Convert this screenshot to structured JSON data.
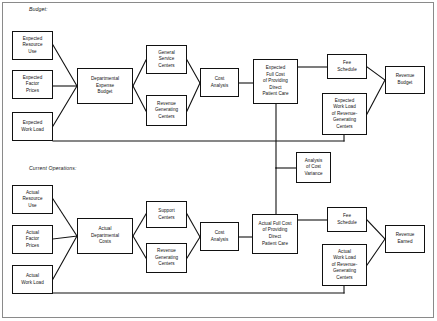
{
  "diagram": {
    "sections": [
      {
        "id": "budget",
        "label": "Budget:"
      },
      {
        "id": "current",
        "label": "Current Operations:"
      }
    ],
    "nodes": [
      {
        "id": "expected-resource-use",
        "label": "Expected\nResource\nUse",
        "x": 12,
        "y": 31,
        "w": 41,
        "h": 29
      },
      {
        "id": "expected-factor-prices",
        "label": "Expected\nFactor\nPrices",
        "x": 12,
        "y": 70,
        "w": 41,
        "h": 29
      },
      {
        "id": "expected-work-load",
        "label": "Expected\nWork Load",
        "x": 12,
        "y": 112,
        "w": 41,
        "h": 29
      },
      {
        "id": "departmental-expense-budget",
        "label": "Departmental\nExpense\nBudget",
        "x": 77,
        "y": 68,
        "w": 56,
        "h": 36
      },
      {
        "id": "general-service-centers",
        "label": "General\nService\nCenters",
        "x": 146,
        "y": 45,
        "w": 41,
        "h": 29
      },
      {
        "id": "revenue-generating-centers-b",
        "label": "Revenue\nGenerating\nCenters",
        "x": 146,
        "y": 95,
        "w": 41,
        "h": 31
      },
      {
        "id": "cost-analysis-budget",
        "label": "Cost\nAnalysis",
        "x": 200,
        "y": 68,
        "w": 39,
        "h": 29
      },
      {
        "id": "expected-full-cost",
        "label": "Expected\nFull Cost\nof Providing\nDirect\nPatient Care",
        "x": 253,
        "y": 59,
        "w": 45,
        "h": 45
      },
      {
        "id": "fee-schedule-budget",
        "label": "Fee\nSchedule",
        "x": 327,
        "y": 54,
        "w": 40,
        "h": 25
      },
      {
        "id": "expected-work-load-rgc",
        "label": "Expected\nWork Load\nof Revenue-\nGenerating\nCenters",
        "x": 322,
        "y": 93,
        "w": 45,
        "h": 42
      },
      {
        "id": "revenue-budget",
        "label": "Revenue\nBudget",
        "x": 385,
        "y": 66,
        "w": 40,
        "h": 28
      },
      {
        "id": "analysis-of-cost-variance",
        "label": "Analysis\nof Cost\nVariance",
        "x": 296,
        "y": 152,
        "w": 35,
        "h": 31
      },
      {
        "id": "actual-resource-use",
        "label": "Actual\nResource\nUse",
        "x": 12,
        "y": 185,
        "w": 41,
        "h": 29
      },
      {
        "id": "actual-factor-prices",
        "label": "Actual\nFactor\nPrices",
        "x": 12,
        "y": 225,
        "w": 41,
        "h": 29
      },
      {
        "id": "actual-work-load",
        "label": "Actual\nWork Load",
        "x": 12,
        "y": 265,
        "w": 41,
        "h": 29
      },
      {
        "id": "actual-departmental-costs",
        "label": "Actual\nDepartmental\nCosts",
        "x": 77,
        "y": 218,
        "w": 56,
        "h": 36
      },
      {
        "id": "support-centers",
        "label": "Support\nCenters",
        "x": 146,
        "y": 201,
        "w": 41,
        "h": 27
      },
      {
        "id": "revenue-generating-centers-c",
        "label": "Revenue\nGenerating\nCenters",
        "x": 146,
        "y": 243,
        "w": 41,
        "h": 30
      },
      {
        "id": "cost-analysis-current",
        "label": "Cost\nAnalysis",
        "x": 200,
        "y": 222,
        "w": 39,
        "h": 29
      },
      {
        "id": "actual-full-cost",
        "label": "Actual Full Cost\nof Providing\nDirect\nPatient Care",
        "x": 252,
        "y": 214,
        "w": 46,
        "h": 40
      },
      {
        "id": "fee-schedule-current",
        "label": "Fee\nSchedule",
        "x": 327,
        "y": 207,
        "w": 40,
        "h": 25
      },
      {
        "id": "actual-work-load-rgc",
        "label": "Actual\nWork Load\nof Revenue-\nGenerating\nCenters",
        "x": 322,
        "y": 244,
        "w": 45,
        "h": 42
      },
      {
        "id": "revenue-earned",
        "label": "Revenue\nEarned",
        "x": 385,
        "y": 225,
        "w": 40,
        "h": 28
      }
    ],
    "edges": [
      {
        "id": "era-to-deb",
        "from": "expected-resource-use",
        "to": "departmental-expense-budget"
      },
      {
        "id": "efp-to-deb",
        "from": "expected-factor-prices",
        "to": "departmental-expense-budget"
      },
      {
        "id": "ewl-to-deb",
        "from": "expected-work-load",
        "to": "departmental-expense-budget"
      },
      {
        "id": "deb-to-gsc",
        "from": "departmental-expense-budget",
        "to": "general-service-centers"
      },
      {
        "id": "deb-to-rgc",
        "from": "departmental-expense-budget",
        "to": "revenue-generating-centers-b"
      },
      {
        "id": "gsc-to-ca",
        "from": "general-service-centers",
        "to": "cost-analysis-budget"
      },
      {
        "id": "rgc-to-ca",
        "from": "revenue-generating-centers-b",
        "to": "cost-analysis-budget"
      },
      {
        "id": "ca-to-efc",
        "from": "cost-analysis-budget",
        "to": "expected-full-cost"
      },
      {
        "id": "efc-to-fee",
        "from": "expected-full-cost",
        "to": "fee-schedule-budget"
      },
      {
        "id": "fee-to-rb",
        "from": "fee-schedule-budget",
        "to": "revenue-budget"
      },
      {
        "id": "ewlrgc-to-rb",
        "from": "expected-work-load-rgc",
        "to": "revenue-budget"
      },
      {
        "id": "ewl-to-ewlrgc",
        "from": "expected-work-load",
        "to": "expected-work-load-rgc"
      },
      {
        "id": "efc-to-acv",
        "from": "expected-full-cost",
        "to": "analysis-of-cost-variance"
      },
      {
        "id": "afc-to-acv",
        "from": "actual-full-cost",
        "to": "analysis-of-cost-variance"
      },
      {
        "id": "aru-to-adc",
        "from": "actual-resource-use",
        "to": "actual-departmental-costs"
      },
      {
        "id": "afp-to-adc",
        "from": "actual-factor-prices",
        "to": "actual-departmental-costs"
      },
      {
        "id": "awl-to-adc",
        "from": "actual-work-load",
        "to": "actual-departmental-costs"
      },
      {
        "id": "adc-to-sc",
        "from": "actual-departmental-costs",
        "to": "support-centers"
      },
      {
        "id": "adc-to-rgc",
        "from": "actual-departmental-costs",
        "to": "revenue-generating-centers-c"
      },
      {
        "id": "sc-to-ca",
        "from": "support-centers",
        "to": "cost-analysis-current"
      },
      {
        "id": "rgc-to-ca2",
        "from": "revenue-generating-centers-c",
        "to": "cost-analysis-current"
      },
      {
        "id": "ca-to-afc",
        "from": "cost-analysis-current",
        "to": "actual-full-cost"
      },
      {
        "id": "afc-to-fee",
        "from": "actual-full-cost",
        "to": "fee-schedule-current"
      },
      {
        "id": "fee-to-re",
        "from": "fee-schedule-current",
        "to": "revenue-earned"
      },
      {
        "id": "awlrgc-to-re",
        "from": "actual-work-load-rgc",
        "to": "revenue-earned"
      },
      {
        "id": "awl-to-awlrgc",
        "from": "actual-work-load",
        "to": "actual-work-load-rgc"
      }
    ]
  }
}
